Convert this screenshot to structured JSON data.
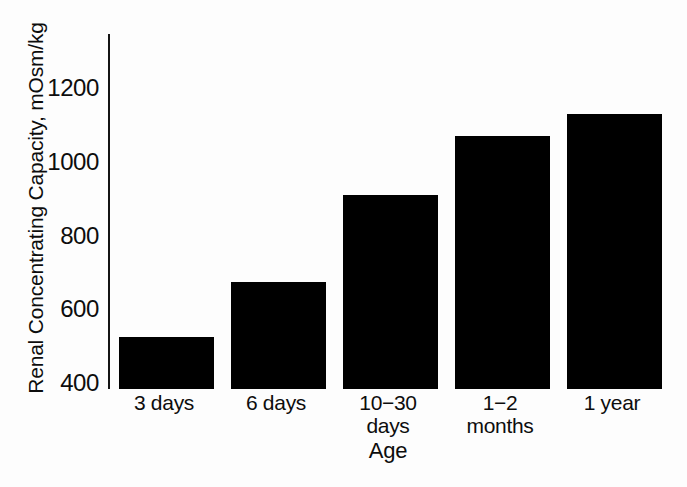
{
  "chart_data": {
    "type": "bar",
    "title": "",
    "xlabel": "Age",
    "ylabel": "Renal Concentrating Capacity, mOsm/kg",
    "categories": [
      "3 days",
      "6 days",
      "10−30 days",
      "1−2 months",
      "1 year"
    ],
    "category_lines": [
      [
        "3 days",
        ""
      ],
      [
        "6 days",
        ""
      ],
      [
        "10−30",
        "days"
      ],
      [
        "1−2",
        "months"
      ],
      [
        "1 year",
        ""
      ]
    ],
    "values": [
      525,
      675,
      910,
      1070,
      1130
    ],
    "units": "mOsm/kg",
    "ylim": [
      400,
      1280
    ],
    "yticks": [
      400,
      600,
      800,
      1000,
      1200
    ],
    "ytick_labels": [
      "400",
      "600",
      "800",
      "1000",
      "1200"
    ],
    "grid": false,
    "legend": false,
    "bar_color": "#000000",
    "axis_color": "#141414",
    "background": "#fdfdfd"
  }
}
